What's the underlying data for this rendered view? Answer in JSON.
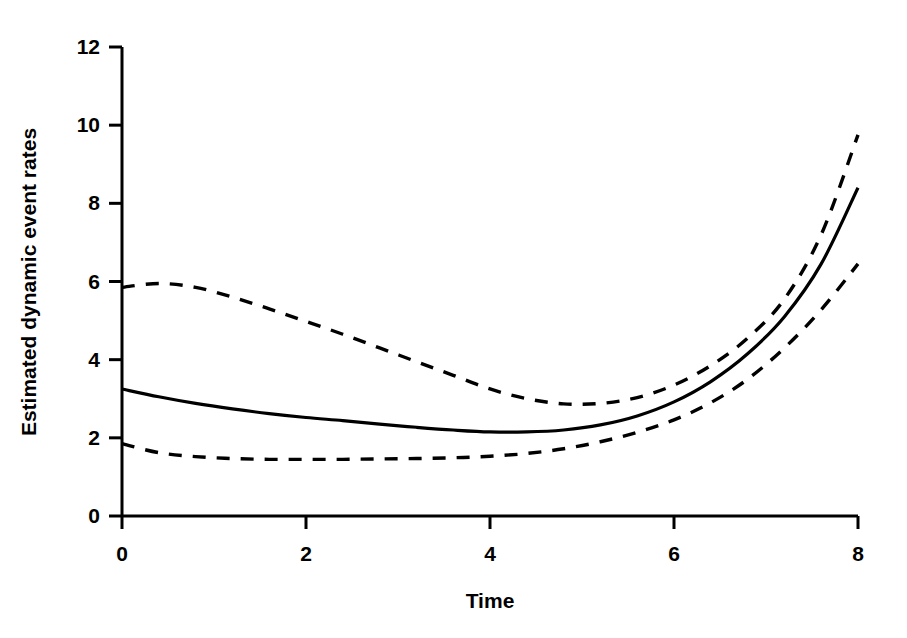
{
  "chart_data": {
    "type": "line",
    "title": "",
    "xlabel": "Time",
    "ylabel": "Estimated dynamic event rates",
    "xlim": [
      0,
      8
    ],
    "ylim": [
      0,
      12
    ],
    "xticks": [
      "0",
      "2",
      "4",
      "6",
      "8"
    ],
    "xtick_values": [
      0,
      2,
      4,
      6,
      8
    ],
    "yticks": [
      "0",
      "2",
      "4",
      "6",
      "8",
      "10",
      "12"
    ],
    "ytick_values": [
      0,
      2,
      4,
      6,
      8,
      10,
      12
    ],
    "grid": false,
    "legend": "none",
    "x": [
      0,
      0.4,
      0.8,
      1.2,
      1.6,
      2.0,
      2.4,
      2.8,
      3.2,
      3.6,
      4.0,
      4.4,
      4.8,
      5.2,
      5.6,
      6.0,
      6.4,
      6.8,
      7.2,
      7.6,
      8.0
    ],
    "series": [
      {
        "name": "Estimated dynamic event rate",
        "style": "solid",
        "color": "#000000",
        "values": [
          3.25,
          3.05,
          2.88,
          2.74,
          2.62,
          2.52,
          2.44,
          2.35,
          2.27,
          2.2,
          2.15,
          2.15,
          2.2,
          2.33,
          2.56,
          2.92,
          3.44,
          4.15,
          5.1,
          6.45,
          8.4
        ]
      },
      {
        "name": "Upper 95% confidence limit",
        "style": "dashed",
        "color": "#000000",
        "values": [
          5.85,
          5.95,
          5.85,
          5.6,
          5.3,
          4.98,
          4.65,
          4.3,
          3.95,
          3.6,
          3.25,
          3.0,
          2.87,
          2.88,
          3.03,
          3.35,
          3.85,
          4.55,
          5.55,
          7.2,
          9.75
        ]
      },
      {
        "name": "Lower 95% confidence limit",
        "style": "dashed",
        "color": "#000000",
        "values": [
          1.85,
          1.62,
          1.52,
          1.47,
          1.45,
          1.45,
          1.45,
          1.46,
          1.47,
          1.49,
          1.53,
          1.6,
          1.72,
          1.9,
          2.14,
          2.46,
          2.9,
          3.5,
          4.3,
          5.28,
          6.45
        ]
      }
    ]
  },
  "axes": {
    "x_title": "Time",
    "y_title": "Estimated dynamic event rates"
  }
}
